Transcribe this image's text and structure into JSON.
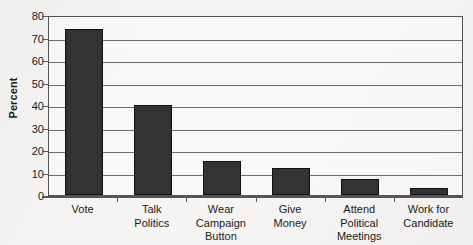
{
  "chart_data": {
    "type": "bar",
    "title": "",
    "xlabel": "",
    "ylabel": "Percent",
    "ylim": [
      0,
      80
    ],
    "ytick_step": 10,
    "yticks": [
      0,
      10,
      20,
      30,
      40,
      50,
      60,
      70,
      80
    ],
    "ytick_labels": [
      "0",
      "10",
      "20",
      "30",
      "40",
      "50",
      "60",
      "70",
      "80"
    ],
    "grid": true,
    "legend": false,
    "categories": [
      "Vote",
      "Talk Politics",
      "Wear Campaign Button",
      "Give Money",
      "Attend Political Meetings",
      "Work for Candidate"
    ],
    "category_label_lines": [
      [
        "Vote"
      ],
      [
        "Talk",
        "Politics"
      ],
      [
        "Wear",
        "Campaign",
        "Button"
      ],
      [
        "Give",
        "Money"
      ],
      [
        "Attend",
        "Political",
        "Meetings"
      ],
      [
        "Work for",
        "Candidate"
      ]
    ],
    "values": [
      74,
      40,
      15,
      12,
      7,
      3
    ],
    "bar_color": "#333333",
    "bar_edge_color": "#111111",
    "axis_color": "#555555",
    "gridline_color": "#6e6e6e",
    "background_color": "#f5f4f2"
  }
}
